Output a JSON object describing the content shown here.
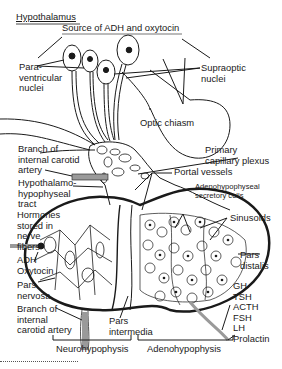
{
  "title": "Hypothalamus",
  "labels": {
    "source": "Source of ADH and oxytocin",
    "paraventricular": [
      "Para-",
      "ventricular",
      "nuclei"
    ],
    "supraoptic": [
      "Supraoptic",
      "nuclei"
    ],
    "optic_chiasm": "Optic chiasm",
    "branch_carotid_top": [
      "Branch of",
      "internal carotid",
      "artery"
    ],
    "primary_plexus": [
      "Primary",
      "capillary plexus"
    ],
    "portal_vessels": "Portal vessels",
    "hypothalamo_tract": [
      "Hypothalamo-",
      "hypophyseal",
      "tract"
    ],
    "secretory_cells": [
      "Adenohypophyseal",
      "secretory cells"
    ],
    "hormones_stored": [
      "Hormones",
      "stored in",
      "nerve",
      "fibers"
    ],
    "sinusoids": "Sinusoids",
    "adh_oxytocin": [
      "ADH",
      "Oxytocin"
    ],
    "pars_distalis": [
      "Pars",
      "distalis"
    ],
    "pars_nervosa": [
      "Pars",
      "nervosa"
    ],
    "hormones_list": [
      "GH",
      "TSH",
      "ACTH",
      "FSH",
      "LH",
      "Prolactin"
    ],
    "branch_carotid_bottom": [
      "Branch of",
      "internal",
      "carotid artery"
    ],
    "pars_intermedia": [
      "Pars",
      "intermedia"
    ],
    "neurohypophysis": "Neurohypophysis",
    "adenohypophysis": "Adenohypophysis"
  },
  "colors": {
    "ink": "#1a1a1a",
    "shade": "#9a9a9a",
    "paper": "#ffffff"
  }
}
